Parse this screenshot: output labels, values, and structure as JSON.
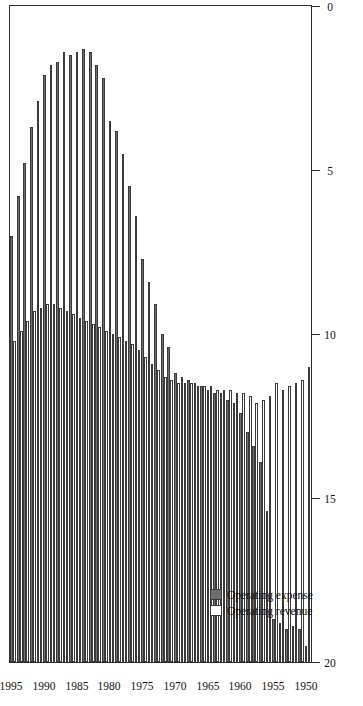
{
  "chart_data": {
    "type": "bar",
    "orientation": "horizontal",
    "title": "",
    "xlabel": "",
    "ylabel": "",
    "xlim": [
      0,
      20
    ],
    "ylim": [
      1949.5,
      1995.5
    ],
    "grid": false,
    "legend_position": "bottom-left",
    "value_ticks": [
      0,
      5,
      10,
      15,
      20
    ],
    "value_tick_labels": [
      "0",
      "5",
      "10",
      "15",
      "20"
    ],
    "category_ticks": [
      1950,
      1955,
      1960,
      1965,
      1970,
      1975,
      1980,
      1985,
      1990,
      1995
    ],
    "category_tick_labels": [
      "1950",
      "1955",
      "1960",
      "1965",
      "1970",
      "1975",
      "1980",
      "1985",
      "1990",
      "1995"
    ],
    "categories": [
      1950,
      1951,
      1952,
      1953,
      1954,
      1955,
      1956,
      1957,
      1958,
      1959,
      1960,
      1961,
      1962,
      1963,
      1964,
      1965,
      1966,
      1967,
      1968,
      1969,
      1970,
      1971,
      1972,
      1973,
      1974,
      1975,
      1976,
      1977,
      1978,
      1979,
      1980,
      1981,
      1982,
      1983,
      1984,
      1985,
      1986,
      1987,
      1988,
      1989,
      1990,
      1991,
      1992,
      1993,
      1994,
      1995
    ],
    "series": [
      {
        "name": "Operating expense",
        "color": "#6e6e6e",
        "values": [
          0.5,
          1.0,
          1.1,
          1.0,
          1.2,
          1.3,
          4.6,
          6.1,
          6.6,
          7.0,
          7.6,
          7.9,
          8.0,
          8.2,
          8.2,
          8.3,
          8.4,
          8.5,
          8.6,
          8.7,
          8.8,
          9.6,
          10.0,
          10.9,
          11.6,
          12.3,
          13.6,
          14.5,
          15.5,
          16.2,
          16.5,
          17.8,
          18.2,
          18.6,
          18.7,
          18.6,
          18.5,
          18.6,
          18.3,
          18.2,
          17.9,
          17.1,
          16.3,
          15.2,
          14.2,
          13.0
        ]
      },
      {
        "name": "Operating revenue",
        "color": "#ffffff",
        "values": [
          9.0,
          8.6,
          8.5,
          8.4,
          8.3,
          8.5,
          8.1,
          8.0,
          7.9,
          8.1,
          8.2,
          8.2,
          8.3,
          8.3,
          8.3,
          8.4,
          8.4,
          8.4,
          8.5,
          8.5,
          8.5,
          8.6,
          8.7,
          8.9,
          9.1,
          9.3,
          9.5,
          9.7,
          9.8,
          9.9,
          10.0,
          10.1,
          10.2,
          10.3,
          10.4,
          10.5,
          10.6,
          10.7,
          10.8,
          10.9,
          10.9,
          10.8,
          10.7,
          10.4,
          10.1,
          9.8
        ]
      }
    ]
  },
  "legend": {
    "items": [
      {
        "label": "Operating expense",
        "swatch": "expense"
      },
      {
        "label": "Operating revenue",
        "swatch": "revenue"
      }
    ]
  }
}
